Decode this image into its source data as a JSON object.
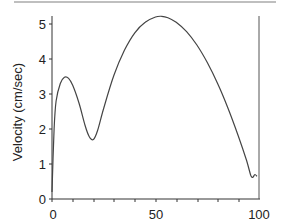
{
  "chart_data": {
    "type": "line",
    "title": "",
    "xlabel": "",
    "ylabel": "Velocity (cm/sec)",
    "xlim": [
      0,
      100
    ],
    "ylim": [
      0,
      5.2
    ],
    "x_ticks": [
      "0",
      "50",
      "100"
    ],
    "y_ticks": [
      "0",
      "1",
      "2",
      "3",
      "4",
      "5"
    ],
    "grid": false,
    "series": [
      {
        "name": "velocity",
        "x": [
          0,
          1,
          2,
          4,
          6,
          8,
          10,
          13,
          16,
          18,
          20,
          22,
          25,
          30,
          35,
          40,
          45,
          50,
          53,
          56,
          60,
          65,
          70,
          75,
          80,
          85,
          90,
          94,
          96,
          97,
          98,
          99
        ],
        "values": [
          0.2,
          2.0,
          2.8,
          3.3,
          3.48,
          3.45,
          3.25,
          2.75,
          2.1,
          1.78,
          1.7,
          1.95,
          2.6,
          3.55,
          4.25,
          4.75,
          5.05,
          5.2,
          5.22,
          5.18,
          5.05,
          4.78,
          4.4,
          3.9,
          3.3,
          2.6,
          1.8,
          1.1,
          0.68,
          0.62,
          0.7,
          0.65
        ]
      }
    ]
  },
  "labels": {
    "ylabel": "Velocity (cm/sec)",
    "x0": "0",
    "x50": "50",
    "x100": "100",
    "y0": "0",
    "y1": "1",
    "y2": "2",
    "y3": "3",
    "y4": "4",
    "y5": "5"
  }
}
